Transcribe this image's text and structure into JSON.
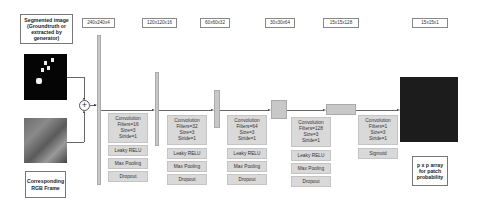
{
  "inputs": {
    "segmented_label": "Segmented image (Groundtruth or extracted by generator)",
    "rgb_label": "Corresponding RGB Frame",
    "combine_symbol": "+"
  },
  "stages": [
    {
      "dims": "240x240x4"
    },
    {
      "dims": "120x120x16",
      "ops": {
        "conv": [
          "Convolution",
          "Filters=16",
          "Size=3",
          "Stride=1"
        ],
        "act": "Leaky RELU",
        "pool": "Max Pooling",
        "drop": "Dropout"
      }
    },
    {
      "dims": "60x60x32",
      "ops": {
        "conv": [
          "Convolution",
          "Filters=32",
          "Size=3",
          "Stride=1"
        ],
        "act": "Leaky RELU",
        "pool": "Max Pooling",
        "drop": "Dropout"
      }
    },
    {
      "dims": "30x30x64",
      "ops": {
        "conv": [
          "Convolution",
          "Filters=64",
          "Size=3",
          "Stride=1"
        ],
        "act": "Leaky RELU",
        "pool": "Max Pooling",
        "drop": "Dropout"
      }
    },
    {
      "dims": "15x15x128",
      "ops": {
        "conv": [
          "Convolution",
          "Filters=128",
          "Size=3",
          "Stride=1"
        ],
        "act": "Leaky RELU",
        "pool": "Max Pooling",
        "drop": "Dropout"
      }
    },
    {
      "dims": "15x15x1",
      "ops": {
        "conv": [
          "Convolution",
          "Filters=1",
          "Size=3",
          "Stride=1"
        ],
        "act": "Sigmoid"
      }
    }
  ],
  "output": {
    "label": "p x p array for patch probability"
  }
}
